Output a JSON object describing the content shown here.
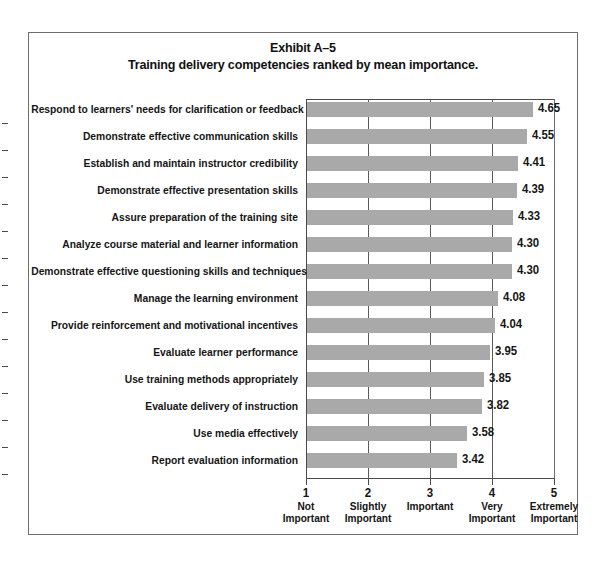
{
  "figure": {
    "title_line1": "Exhibit A–5",
    "title_line2": "Training delivery competencies ranked by mean importance."
  },
  "colors": {
    "bar_fill": "#a9a9a9",
    "axis": "#4a4a4a",
    "frame": "#6e6e6e",
    "text": "#151515",
    "background": "#ffffff"
  },
  "chart_data": {
    "type": "bar",
    "orientation": "horizontal",
    "title": "Exhibit A–5 Training delivery competencies ranked by mean importance.",
    "xlabel": "",
    "ylabel": "",
    "xlim": [
      1,
      5
    ],
    "grid": true,
    "legend": "none",
    "categories": [
      "Respond to learners' needs for clarification or feedback",
      "Demonstrate effective communication skills",
      "Establish and maintain instructor credibility",
      "Demonstrate effective presentation skills",
      "Assure preparation of the training site",
      "Analyze course material and learner information",
      "Demonstrate effective questioning skills and techniques",
      "Manage the learning environment",
      "Provide reinforcement and motivational incentives",
      "Evaluate learner performance",
      "Use training methods appropriately",
      "Evaluate delivery of instruction",
      "Use media effectively",
      "Report evaluation information"
    ],
    "values": [
      4.65,
      4.55,
      4.41,
      4.39,
      4.33,
      4.3,
      4.3,
      4.08,
      4.04,
      3.95,
      3.85,
      3.82,
      3.58,
      3.42
    ],
    "value_labels": [
      "4.65",
      "4.55",
      "4.41",
      "4.39",
      "4.33",
      "4.30",
      "4.30",
      "4.08",
      "4.04",
      "3.95",
      "3.85",
      "3.82",
      "3.58",
      "3.42"
    ],
    "xticks": [
      {
        "value": "1",
        "word1": "Not",
        "word2": "Important"
      },
      {
        "value": "2",
        "word1": "Slightly",
        "word2": "Important"
      },
      {
        "value": "3",
        "word1": "Important",
        "word2": ""
      },
      {
        "value": "4",
        "word1": "Very",
        "word2": "Important"
      },
      {
        "value": "5",
        "word1": "Extremely",
        "word2": "Important"
      }
    ]
  }
}
